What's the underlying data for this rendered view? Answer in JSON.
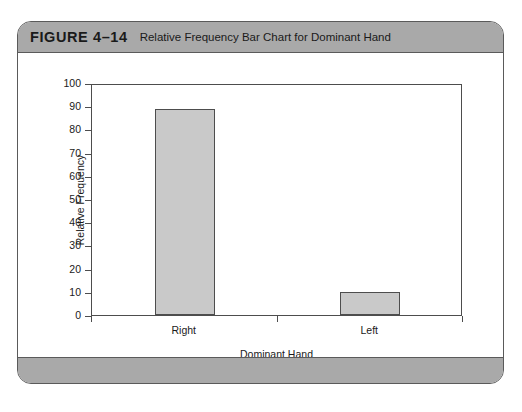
{
  "figure": {
    "number": "FIGURE 4–14",
    "caption": "Relative Frequency Bar Chart for Dominant Hand"
  },
  "colors": {
    "bar_fill": "#c9c9c9",
    "bar_stroke": "#4d4d4d",
    "header_band": "#a9a9a9",
    "card_border": "#5a5a5a",
    "axis": "#4d4d4d",
    "text": "#1a1a1a"
  },
  "chart_data": {
    "type": "bar",
    "title": "Relative Frequency Bar Chart for Dominant Hand",
    "categories": [
      "Right",
      "Left"
    ],
    "values": [
      89,
      10
    ],
    "xlabel": "Dominant Hand",
    "ylabel": "Relative Frequency",
    "ylim": [
      0,
      100
    ],
    "yticks": [
      0,
      10,
      20,
      30,
      40,
      50,
      60,
      70,
      80,
      90,
      100
    ],
    "ytick_labels": [
      "0",
      "10",
      "20",
      "30",
      "40",
      "50",
      "60",
      "70",
      "80",
      "90",
      "100"
    ],
    "grid": false,
    "legend": null,
    "series": [
      {
        "name": "Relative Frequency",
        "values": [
          89,
          10
        ]
      }
    ]
  }
}
